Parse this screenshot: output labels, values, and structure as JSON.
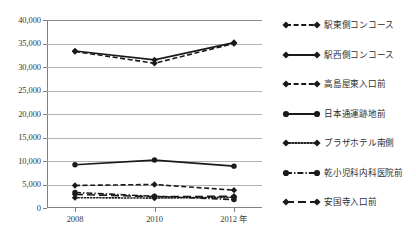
{
  "chart_data": {
    "type": "line",
    "title": "",
    "xlabel": "年",
    "ylabel": "",
    "x": [
      2008,
      2010,
      2012
    ],
    "categories": [
      "2008",
      "2010",
      "2012 年"
    ],
    "xtick_labels": [
      "2008",
      "2010",
      "2012 年"
    ],
    "ytick_labels": [
      "0",
      "5,000",
      "10,000",
      "15,000",
      "20,000",
      "25,000",
      "30,000",
      "35,000",
      "40,000"
    ],
    "ytick_values": [
      0,
      5000,
      10000,
      15000,
      20000,
      25000,
      30000,
      35000,
      40000
    ],
    "ylim": [
      0,
      40000
    ],
    "grid": true,
    "legend_position": "right",
    "line_color": "#1a1a1a",
    "grid_color": "#b4b4b4",
    "series": [
      {
        "name": "駅東側コンコース",
        "style": "dashed",
        "marker": "diamond",
        "values": [
          33300,
          30800,
          35000
        ]
      },
      {
        "name": "駅西側コンコース",
        "style": "solid",
        "marker": "diamond",
        "values": [
          33400,
          31500,
          35200
        ]
      },
      {
        "name": "高島屋東入口前",
        "style": "dashed",
        "marker": "diamond",
        "values": [
          4800,
          5000,
          3800
        ]
      },
      {
        "name": "日本通運跡地前",
        "style": "solid",
        "marker": "circle",
        "values": [
          9200,
          10200,
          8900
        ]
      },
      {
        "name": "プラザホテル南側",
        "style": "dotted",
        "marker": "diamond",
        "values": [
          2200,
          2100,
          2300
        ]
      },
      {
        "name": "乾小児科内科医院前",
        "style": "dashdot",
        "marker": "circle",
        "values": [
          3300,
          2500,
          1800
        ]
      },
      {
        "name": "安国寺入口前",
        "style": "longdash",
        "marker": "diamond",
        "values": [
          2900,
          2400,
          2500
        ]
      }
    ]
  }
}
